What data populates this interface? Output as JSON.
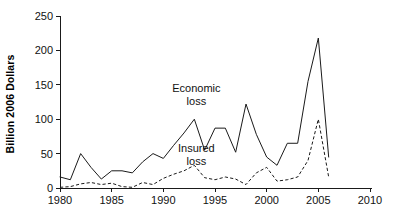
{
  "chart_data": {
    "type": "line",
    "title": "",
    "xlabel": "",
    "ylabel": "Billion 2006 Dollars",
    "xlim": [
      1980,
      2010
    ],
    "ylim": [
      0,
      250
    ],
    "grid": false,
    "legend": "inline-annotations",
    "xticks": [
      "1980",
      "1985",
      "1990",
      "1995",
      "2000",
      "2005",
      "2010"
    ],
    "xtick_values": [
      1980,
      1985,
      1990,
      1995,
      2000,
      2005,
      2010
    ],
    "yticks": [
      "0",
      "50",
      "100",
      "150",
      "200",
      "250"
    ],
    "ytick_values": [
      0,
      50,
      100,
      150,
      200,
      250
    ],
    "x": [
      1980,
      1981,
      1982,
      1983,
      1984,
      1985,
      1986,
      1987,
      1988,
      1989,
      1990,
      1991,
      1992,
      1993,
      1994,
      1995,
      1996,
      1997,
      1998,
      1999,
      2000,
      2001,
      2002,
      2003,
      2004,
      2005,
      2006
    ],
    "series": [
      {
        "name": "Economic loss",
        "style": "solid",
        "label_line1": "Economic",
        "label_line2": "loss",
        "values": [
          16,
          12,
          50,
          30,
          13,
          25,
          25,
          22,
          38,
          50,
          43,
          62,
          80,
          100,
          55,
          87,
          87,
          52,
          122,
          78,
          45,
          33,
          65,
          65,
          155,
          218,
          45
        ]
      },
      {
        "name": "Insured loss",
        "style": "dashed",
        "label_line1": "Insured",
        "label_line2": "loss",
        "values": [
          1,
          2,
          6,
          8,
          5,
          7,
          2,
          1,
          8,
          5,
          14,
          20,
          25,
          33,
          15,
          12,
          16,
          13,
          5,
          22,
          30,
          10,
          12,
          16,
          40,
          100,
          16
        ]
      }
    ],
    "annotations": [
      {
        "text": "Economic loss",
        "x": 1993.2,
        "y": 140
      },
      {
        "text": "Insured loss",
        "x": 1993.2,
        "y": 52
      }
    ],
    "colors": {
      "line": "#1a1a1a",
      "text": "#111111",
      "background": "#ffffff"
    }
  }
}
